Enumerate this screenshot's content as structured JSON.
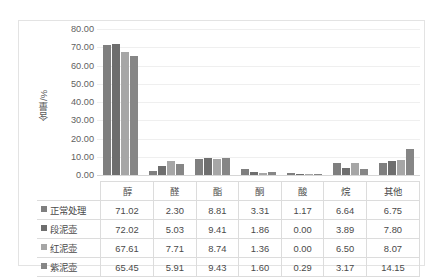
{
  "chart_data": {
    "type": "bar",
    "title": "",
    "subtitle": "",
    "xlabel": "",
    "ylabel": "含量/%",
    "ylim": [
      0,
      80
    ],
    "ytick_step": 10,
    "ytick_labels": [
      "80.00",
      "70.00",
      "60.00",
      "50.00",
      "40.00",
      "30.00",
      "20.00",
      "10.00",
      "0.00"
    ],
    "grid": true,
    "legend_position": "data-table-row-headers",
    "categories": [
      "醇",
      "醛",
      "酯",
      "酮",
      "酸",
      "烷",
      "其他"
    ],
    "series": [
      {
        "name": "正常处理",
        "color": "#7f7f7f",
        "values": [
          71.02,
          2.3,
          8.81,
          3.31,
          1.17,
          6.64,
          6.75
        ]
      },
      {
        "name": "段泥壶",
        "color": "#6e6e6e",
        "values": [
          72.02,
          5.03,
          9.41,
          1.86,
          0.0,
          3.89,
          7.8
        ]
      },
      {
        "name": "红泥壶",
        "color": "#a6a6a6",
        "values": [
          67.61,
          7.71,
          8.74,
          1.36,
          0.0,
          6.5,
          8.07
        ]
      },
      {
        "name": "紫泥壶",
        "color": "#868686",
        "values": [
          65.45,
          5.91,
          9.43,
          1.6,
          0.29,
          3.17,
          14.15
        ]
      }
    ],
    "value_labels": {
      "正常处理": [
        "71.02",
        "2.30",
        "8.81",
        "3.31",
        "1.17",
        "6.64",
        "6.75"
      ],
      "段泥壶": [
        "72.02",
        "5.03",
        "9.41",
        "1.86",
        "0.00",
        "3.89",
        "7.80"
      ],
      "红泥壶": [
        "67.61",
        "7.71",
        "8.74",
        "1.36",
        "0.00",
        "6.50",
        "8.07"
      ],
      "紫泥壶": [
        "65.45",
        "5.91",
        "9.43",
        "1.60",
        "0.29",
        "3.17",
        "14.15"
      ]
    }
  },
  "colors": {
    "frame_border": "#e3e3e3",
    "gridline": "#efefef",
    "axis_line": "#d6d6d6",
    "table_border": "#dcdcdc",
    "text": "#4a4a4a",
    "background": "#ffffff"
  }
}
